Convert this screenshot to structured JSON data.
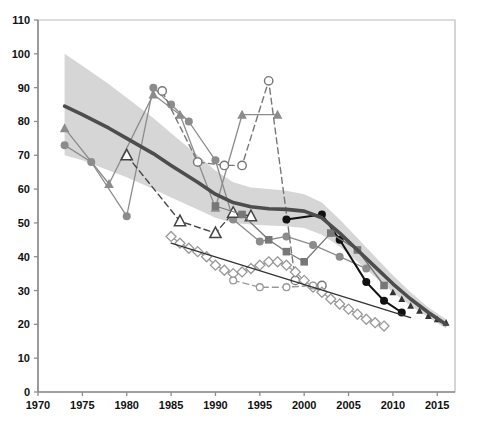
{
  "chart_data": {
    "type": "line",
    "title": "",
    "subtitle": "",
    "xlabel": "",
    "ylabel": "",
    "xlim": [
      1970,
      2017
    ],
    "ylim": [
      0,
      110
    ],
    "grid": false,
    "legend_position": "bottom-cut-off",
    "x_ticks": [
      1970,
      1975,
      1980,
      1985,
      1990,
      1995,
      2000,
      2005,
      2010,
      2015
    ],
    "y_ticks": [
      0,
      10,
      20,
      30,
      40,
      50,
      60,
      70,
      80,
      90,
      100,
      110
    ],
    "colors": {
      "trend_line": "#4d4d4d",
      "confidence_band": "#d4d4d4",
      "black_series": "#111111",
      "dark_gray_series": "#555555",
      "mid_gray_series": "#8c8c8c",
      "light_gray_series": "#b3b3b3",
      "axis": "#999999",
      "text": "#111111"
    },
    "series": [
      {
        "name": "Trend estimate",
        "marker": "none",
        "line": "solid-thick",
        "color": "#4d4d4d",
        "x": [
          1973,
          1975,
          1978,
          1980,
          1983,
          1985,
          1988,
          1990,
          1992,
          1994,
          1996,
          1998,
          2000,
          2002,
          2004,
          2006,
          2008,
          2010,
          2012,
          2014,
          2016
        ],
        "y": [
          84.5,
          82.0,
          78.0,
          75.0,
          70.5,
          67.0,
          62.0,
          58.5,
          56.0,
          54.8,
          54.2,
          54.0,
          53.5,
          51.5,
          47.0,
          42.0,
          37.0,
          32.0,
          27.5,
          23.5,
          20.0
        ]
      },
      {
        "name": "Confidence band upper",
        "marker": "none",
        "line": "band",
        "color": "#d4d4d4",
        "x": [
          1973,
          1975,
          1978,
          1980,
          1983,
          1985,
          1988,
          1990,
          1992,
          1994,
          1996,
          1998,
          2000,
          2002,
          2004,
          2006,
          2008,
          2010,
          2012,
          2014,
          2016
        ],
        "y": [
          100.0,
          96.5,
          91.0,
          87.0,
          81.0,
          76.5,
          70.0,
          65.5,
          62.0,
          60.5,
          60.0,
          59.5,
          58.5,
          56.0,
          51.0,
          45.5,
          40.0,
          34.5,
          29.5,
          25.0,
          21.5
        ]
      },
      {
        "name": "Confidence band lower",
        "marker": "none",
        "line": "band",
        "color": "#d4d4d4",
        "x": [
          1973,
          1975,
          1978,
          1980,
          1983,
          1985,
          1988,
          1990,
          1992,
          1994,
          1996,
          1998,
          2000,
          2002,
          2004,
          2006,
          2008,
          2010,
          2012,
          2014,
          2016
        ],
        "y": [
          70.0,
          68.5,
          65.5,
          63.5,
          60.0,
          57.5,
          54.0,
          51.5,
          50.0,
          49.5,
          49.2,
          49.0,
          48.5,
          46.5,
          43.0,
          38.5,
          34.0,
          29.5,
          25.5,
          22.0,
          18.8
        ]
      },
      {
        "name": "Survey A (filled triangle, light line)",
        "marker": "filled-triangle",
        "line": "solid-thin",
        "color": "#8c8c8c",
        "x": [
          1973,
          1978,
          1983,
          1986,
          1990,
          1993,
          1997
        ],
        "y": [
          78.0,
          61.5,
          88.0,
          82.0,
          54.5,
          82.0,
          82.0
        ]
      },
      {
        "name": "Survey B (filled circle, gray)",
        "marker": "filled-circle",
        "line": "solid-thin",
        "color": "#8c8c8c",
        "x": [
          1973,
          1976,
          1980,
          1983,
          1985,
          1987,
          1990,
          1992,
          1995,
          1998,
          2001,
          2004,
          2007
        ],
        "y": [
          73.0,
          68.0,
          52.0,
          90.0,
          85.0,
          80.0,
          68.5,
          51.0,
          44.5,
          46.0,
          43.5,
          40.0,
          36.5
        ]
      },
      {
        "name": "Survey C (open circle, dashed)",
        "marker": "open-circle",
        "line": "dashed",
        "color": "#777777",
        "x": [
          1984,
          1988,
          1991,
          1993,
          1996,
          1999,
          2002
        ],
        "y": [
          89.0,
          68.0,
          67.0,
          67.0,
          92.0,
          33.0,
          31.5
        ]
      },
      {
        "name": "Survey D (open triangle)",
        "marker": "open-triangle",
        "line": "dashed",
        "color": "#444444",
        "x": [
          1980,
          1986,
          1990,
          1992,
          1994
        ],
        "y": [
          70.0,
          50.5,
          47.0,
          53.0,
          52.0
        ]
      },
      {
        "name": "Survey E (black filled circle)",
        "marker": "filled-circle",
        "line": "solid",
        "color": "#111111",
        "x": [
          1998,
          2002,
          2004,
          2007,
          2009,
          2011
        ],
        "y": [
          51.0,
          52.5,
          45.0,
          32.5,
          27.0,
          23.5
        ]
      },
      {
        "name": "Survey F (gray square)",
        "marker": "filled-square",
        "line": "solid-thin",
        "color": "#777777",
        "x": [
          1990,
          1993,
          1996,
          1998,
          2000,
          2003,
          2006,
          2009
        ],
        "y": [
          55.0,
          52.5,
          45.0,
          41.5,
          38.5,
          47.0,
          42.0,
          31.5
        ]
      },
      {
        "name": "Survey G (open diamond)",
        "marker": "open-diamond",
        "line": "solid-thin",
        "color": "#999999",
        "x": [
          1985,
          1986,
          1987,
          1988,
          1989,
          1990,
          1991,
          1992,
          1993,
          1994,
          1995,
          1996,
          1997,
          1998,
          1999,
          2000,
          2001,
          2002,
          2003,
          2004,
          2005,
          2006,
          2007,
          2008,
          2009
        ],
        "y": [
          46.0,
          44.0,
          42.5,
          41.5,
          40.0,
          37.5,
          36.0,
          35.0,
          35.5,
          36.5,
          37.5,
          38.5,
          38.5,
          37.5,
          35.5,
          33.0,
          31.0,
          29.5,
          27.5,
          26.0,
          24.5,
          23.0,
          21.5,
          20.5,
          19.5
        ]
      },
      {
        "name": "Survey H (small open circle, dashed)",
        "marker": "open-circle-small",
        "line": "dashed",
        "color": "#999999",
        "x": [
          1992,
          1995,
          1998,
          2001
        ],
        "y": [
          33.0,
          31.0,
          31.0,
          31.5
        ]
      },
      {
        "name": "Survey I (straight decline)",
        "marker": "none",
        "line": "solid-thin",
        "color": "#333333",
        "x": [
          1985,
          2012
        ],
        "y": [
          44.0,
          22.0
        ]
      },
      {
        "name": "Projection markers (small triangles)",
        "marker": "filled-triangle-small",
        "line": "none",
        "color": "#333333",
        "x": [
          2010,
          2011,
          2012,
          2013,
          2014,
          2015,
          2016
        ],
        "y": [
          29.5,
          27.5,
          25.5,
          24.0,
          22.5,
          21.5,
          20.5
        ]
      }
    ]
  },
  "axis": {
    "y_labels": [
      "110",
      "100",
      "90",
      "80",
      "70",
      "60",
      "50",
      "40",
      "30",
      "20",
      "10",
      "0"
    ],
    "x_labels": [
      "1970",
      "1975",
      "1980",
      "1985",
      "1990",
      "1995",
      "2000",
      "2005",
      "2010",
      "2015"
    ]
  },
  "legend": {
    "visible": false,
    "note": "legend clipped at bottom edge of image"
  }
}
